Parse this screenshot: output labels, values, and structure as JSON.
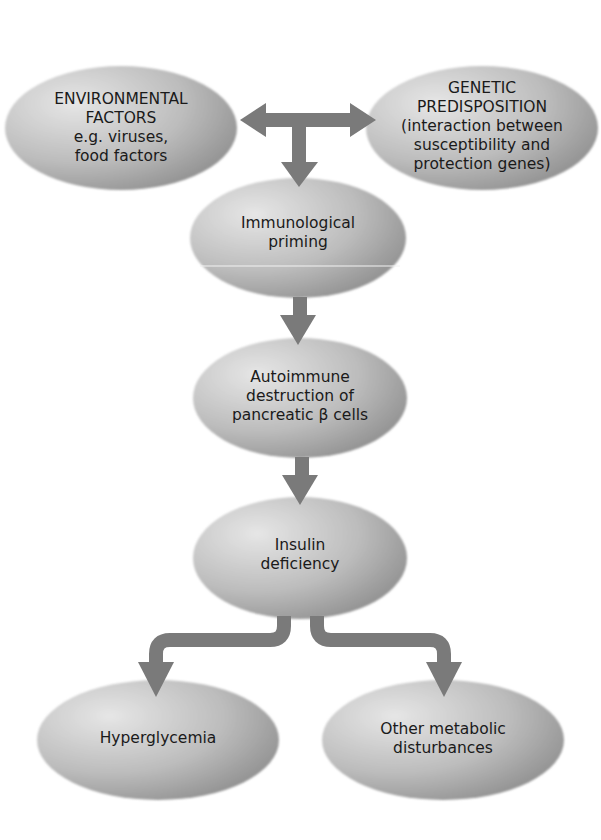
{
  "diagram": {
    "type": "flowchart",
    "colors": {
      "node_fill_light": "#d9d9d9",
      "node_fill_dark": "#8f8f8f",
      "arrow": "#7a7a7a",
      "text": "#1a1a1a",
      "background": "#ffffff"
    },
    "nodes": [
      {
        "id": "environmental",
        "lines": [
          "ENVIRONMENTAL",
          "FACTORS",
          "e.g. viruses,",
          "food factors"
        ]
      },
      {
        "id": "genetic",
        "lines": [
          "GENETIC",
          "PREDISPOSITION",
          "(interaction between",
          "susceptibility and",
          "protection genes)"
        ]
      },
      {
        "id": "immunological",
        "lines": [
          "Immunological",
          "priming"
        ]
      },
      {
        "id": "autoimmune",
        "lines": [
          "Autoimmune",
          "destruction of",
          "pancreatic β cells"
        ]
      },
      {
        "id": "insulin",
        "lines": [
          "Insulin",
          "deficiency"
        ]
      },
      {
        "id": "hyperglycemia",
        "lines": [
          "Hyperglycemia"
        ]
      },
      {
        "id": "other",
        "lines": [
          "Other metabolic",
          "disturbances"
        ]
      }
    ],
    "edges": [
      {
        "from": "junction",
        "to": "environmental",
        "style": "double-arrow"
      },
      {
        "from": "junction",
        "to": "genetic",
        "style": "double-arrow"
      },
      {
        "from": "junction",
        "to": "immunological"
      },
      {
        "from": "immunological",
        "to": "autoimmune"
      },
      {
        "from": "autoimmune",
        "to": "insulin"
      },
      {
        "from": "insulin",
        "to": "hyperglycemia"
      },
      {
        "from": "insulin",
        "to": "other"
      }
    ]
  }
}
